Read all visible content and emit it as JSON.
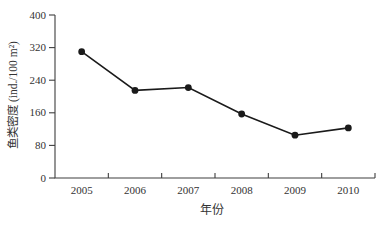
{
  "chart_data": {
    "type": "line",
    "categories": [
      "2005",
      "2006",
      "2007",
      "2008",
      "2009",
      "2010"
    ],
    "series": [
      {
        "name": "鱼类密度",
        "values": [
          310,
          215,
          222,
          157,
          105,
          123
        ]
      }
    ],
    "title": "",
    "xlabel": "年份",
    "ylabel": "鱼类密度 (ind./100 m²)",
    "ylim": [
      0,
      400
    ],
    "yticks": [
      0,
      80,
      160,
      240,
      320,
      400
    ],
    "grid": false,
    "legend": "none",
    "marker": "filled-circle",
    "marker_radius": 3.4,
    "line_width": 1.6,
    "line_color": "#1a1a1a",
    "marker_color": "#1a1a1a",
    "axis_color": "#3f3f3f",
    "text_color": "#333333",
    "background_color": "#ffffff"
  }
}
